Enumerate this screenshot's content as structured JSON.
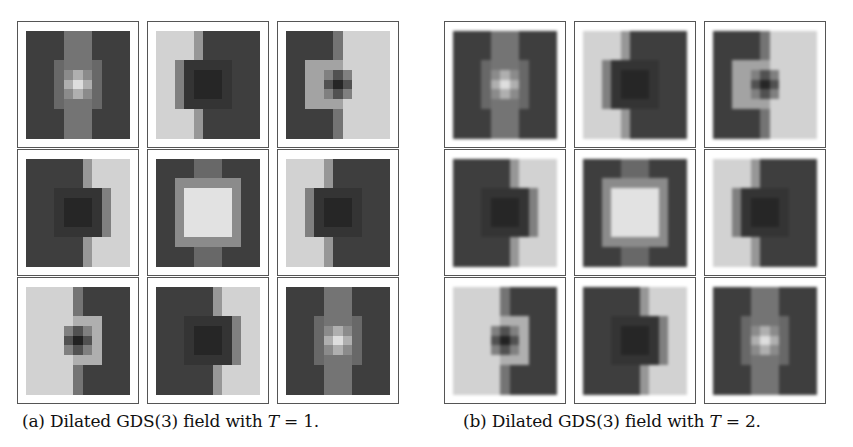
{
  "figure": {
    "panels": [
      {
        "id": "a",
        "caption_prefix": "(a) Dilated GDS(3) field with ",
        "caption_var": "T",
        "caption_suffix": " = 1."
      },
      {
        "id": "b",
        "caption_prefix": "(b) Dilated GDS(3) field with ",
        "caption_var": "T",
        "caption_suffix": " = 2."
      }
    ]
  },
  "chart_data": [
    {
      "type": "heatmap",
      "title": "(a) Dilated GDS(3) field with T = 1.",
      "layout": "3x3 grid of 11x11 grayscale kernels",
      "colormap": "gray (0=black, 1=white)",
      "kernels": [
        {
          "name": "r1c1",
          "pattern": "dark field, light vertical center band, bright center spot"
        },
        {
          "name": "r1c2",
          "pattern": "light left, dark right, dark bump extending left at center"
        },
        {
          "name": "r1c3",
          "pattern": "dark left, light right, light bump with dark center dot"
        },
        {
          "name": "r2c1",
          "pattern": "dark left, light right, dark bump extending right"
        },
        {
          "name": "r2c2",
          "pattern": "dark field, bright central square"
        },
        {
          "name": "r2c3",
          "pattern": "light left, dark right, dark bump extending left"
        },
        {
          "name": "r3c1",
          "pattern": "light left, dark right, light bump with dark center dot"
        },
        {
          "name": "r3c2",
          "pattern": "dark left, light right, dark bump extending right"
        },
        {
          "name": "r3c3",
          "pattern": "dark field, light vertical center band, bright center spot"
        }
      ]
    },
    {
      "type": "heatmap",
      "title": "(b) Dilated GDS(3) field with T = 2.",
      "layout": "3x3 grid of 11x11 grayscale kernels (smoother)",
      "colormap": "gray (0=black, 1=white)",
      "kernels": [
        {
          "name": "r1c1",
          "pattern": "smooth: dark field, light vertical center band, light center"
        },
        {
          "name": "r1c2",
          "pattern": "smooth: light left, dark right-center blob"
        },
        {
          "name": "r1c3",
          "pattern": "smooth: dark left, light right, dark center dot"
        },
        {
          "name": "r2c1",
          "pattern": "smooth: dark left blob, light right"
        },
        {
          "name": "r2c2",
          "pattern": "smooth: dark field, bright central blob"
        },
        {
          "name": "r2c3",
          "pattern": "smooth: light left, dark right blob"
        },
        {
          "name": "r3c1",
          "pattern": "smooth: light left, dark right, dark center dot"
        },
        {
          "name": "r3c2",
          "pattern": "smooth: dark left blob, light right"
        },
        {
          "name": "r3c3",
          "pattern": "smooth: dark field, light vertical band, light center"
        }
      ]
    }
  ]
}
